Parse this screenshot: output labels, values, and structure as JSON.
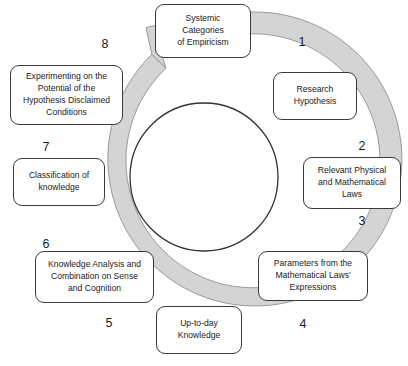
{
  "diagram": {
    "type": "cycle",
    "title": "",
    "center_circle": {
      "label": "",
      "fill": "#ffffff",
      "stroke": "#333333"
    },
    "ring": {
      "fill": "#d4d4d4",
      "stroke": "#9a9a9a",
      "arrow_direction": "clockwise"
    },
    "nodes": [
      {
        "id": "systemic-categories-of-empiricism",
        "text": "Systemic\nCategories\nof Empiricism"
      },
      {
        "id": "research-hypothesis",
        "text": "Research\nHypothesis"
      },
      {
        "id": "relevant-physical-and-mathematical-laws",
        "text": "Relevant Physical\nand Mathematical\nLaws"
      },
      {
        "id": "parameters-from-the-mathematical-laws-expressions",
        "text": "Parameters from the\nMathematical Laws'\nExpressions"
      },
      {
        "id": "up-to-day-knowledge",
        "text": "Up-to-day\nKnowledge"
      },
      {
        "id": "knowledge-analysis-and-combination-on-sense-and-cognition",
        "text": "Knowledge Analysis and\nCombination on Sense\nand Cognition"
      },
      {
        "id": "classification-of-knowledge",
        "text": "Classification of\nknowledge"
      },
      {
        "id": "experimenting-on-the-potential-of-the-hypothesis-disclaimed-conditions",
        "text": "Experimenting on the\nPotential of the\nHypothesis Disclaimed\nConditions"
      }
    ],
    "step_numbers": [
      "1",
      "2",
      "3",
      "4",
      "5",
      "6",
      "7",
      "8"
    ]
  }
}
